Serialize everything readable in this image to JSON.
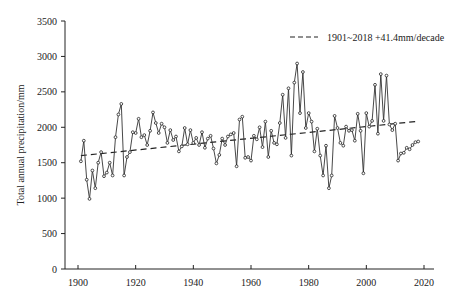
{
  "chart_data": {
    "type": "line",
    "title": "",
    "xlabel": "",
    "ylabel": "Total annual precipitation/mm",
    "xlim": [
      1895,
      2022
    ],
    "ylim": [
      0,
      3500
    ],
    "xticks": [
      1900,
      1920,
      1940,
      1960,
      1980,
      2000,
      2020
    ],
    "yticks": [
      0,
      500,
      1000,
      1500,
      2000,
      2500,
      3000,
      3500
    ],
    "grid": false,
    "legend_position": "upper right",
    "series": [
      {
        "name": "Annual precipitation",
        "style": "solid line with open circle markers",
        "x": [
          1901,
          1902,
          1903,
          1904,
          1905,
          1906,
          1907,
          1908,
          1909,
          1910,
          1911,
          1912,
          1913,
          1914,
          1915,
          1916,
          1917,
          1918,
          1919,
          1920,
          1921,
          1922,
          1923,
          1924,
          1925,
          1926,
          1927,
          1928,
          1929,
          1930,
          1931,
          1932,
          1933,
          1934,
          1935,
          1936,
          1937,
          1938,
          1939,
          1940,
          1941,
          1942,
          1943,
          1944,
          1945,
          1946,
          1947,
          1948,
          1949,
          1950,
          1951,
          1952,
          1953,
          1954,
          1955,
          1956,
          1957,
          1958,
          1959,
          1960,
          1961,
          1962,
          1963,
          1964,
          1965,
          1966,
          1967,
          1968,
          1969,
          1970,
          1971,
          1972,
          1973,
          1974,
          1975,
          1976,
          1977,
          1978,
          1979,
          1980,
          1981,
          1982,
          1983,
          1984,
          1985,
          1986,
          1987,
          1988,
          1989,
          1990,
          1991,
          1992,
          1993,
          1994,
          1995,
          1996,
          1997,
          1998,
          1999,
          2000,
          2001,
          2002,
          2003,
          2004,
          2005,
          2006,
          2007,
          2008,
          2009,
          2010,
          2011,
          2012,
          2013,
          2014,
          2015,
          2016,
          2017,
          2018
        ],
        "values": [
          1520,
          1810,
          1260,
          990,
          1390,
          1140,
          1500,
          1650,
          1310,
          1360,
          1500,
          1320,
          1860,
          2180,
          2330,
          1320,
          1580,
          1650,
          1930,
          1920,
          2120,
          1860,
          1890,
          1750,
          1950,
          2210,
          2060,
          1920,
          2050,
          2000,
          1780,
          1960,
          1820,
          1870,
          1660,
          1730,
          1990,
          1760,
          1960,
          1780,
          1850,
          1750,
          1930,
          1710,
          1840,
          1880,
          1700,
          1490,
          1610,
          1840,
          1750,
          1870,
          1900,
          1920,
          1450,
          2110,
          2150,
          1570,
          1580,
          1530,
          1880,
          1830,
          2000,
          1720,
          2080,
          1580,
          1950,
          1780,
          1760,
          2060,
          2460,
          1850,
          2550,
          1600,
          2630,
          2900,
          2200,
          2780,
          1990,
          2200,
          2080,
          1660,
          1980,
          1600,
          1320,
          1740,
          1140,
          1320,
          2160,
          1990,
          1780,
          1740,
          2010,
          1950,
          1960,
          1810,
          2190,
          1950,
          1350,
          2200,
          2010,
          2090,
          2600,
          1910,
          2750,
          2090,
          2730,
          2040,
          1960,
          2050,
          1530,
          1630,
          1640,
          1710,
          1690,
          1750,
          1790,
          1800
        ]
      },
      {
        "name": "1901~2018 +41.4mm/decade",
        "style": "dashed linear trend",
        "x": [
          1901,
          2018
        ],
        "values": [
          1600,
          2085
        ]
      }
    ],
    "legend": [
      "1901~2018 +41.4mm/decade"
    ]
  }
}
